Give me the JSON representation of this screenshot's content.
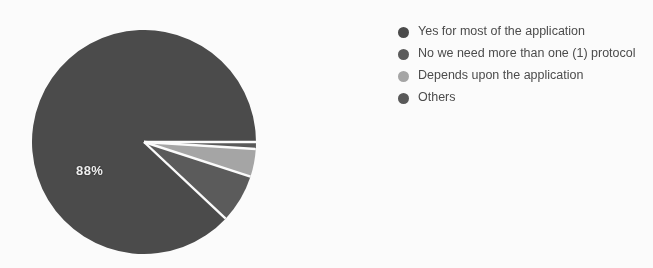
{
  "chart_data": {
    "type": "pie",
    "title": "",
    "categories": [
      "Yes for most of the application",
      "No we need more than one (1) protocol",
      "Depends upon the application",
      "Others"
    ],
    "values": [
      88,
      7,
      4,
      1
    ],
    "value_labels": [
      "88%",
      "",
      "",
      ""
    ],
    "colors": [
      "#4c4c4c",
      "#5c5c5c",
      "#a8a8a8",
      "#5a5a5a"
    ],
    "legend_position": "right",
    "grid": false,
    "slice_separator_color": "#ffffff",
    "label_color": "#f2f2f2",
    "background_color": "#ffffff"
  },
  "chart": {
    "label_main": "88%"
  },
  "legend": {
    "items": [
      {
        "label": "Yes for most of the application",
        "color": "#4c4c4c"
      },
      {
        "label": "No we need more than one (1) protocol",
        "color": "#5c5c5c"
      },
      {
        "label": "Depends upon the application",
        "color": "#a8a8a8"
      },
      {
        "label": "Others",
        "color": "#5a5a5a"
      }
    ]
  }
}
